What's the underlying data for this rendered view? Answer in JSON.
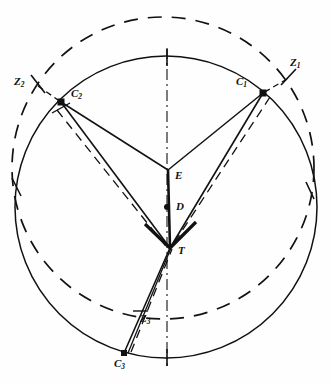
{
  "figure": {
    "colors": {
      "ink": "#111111",
      "background": "#ffffff"
    },
    "circles": [
      {
        "name": "solid-circle",
        "cx": 166,
        "cy": 207,
        "r": 151,
        "style": "solid"
      },
      {
        "name": "dashed-circle",
        "cx": 163,
        "cy": 168,
        "r": 151,
        "style": "dashed"
      }
    ],
    "axis": {
      "name": "vertical-dash-dot-axis",
      "x1": 167,
      "y1": 52,
      "x2": 167,
      "y2": 362,
      "style": "dash-dot"
    },
    "points": [
      {
        "id": "C1",
        "label": "C",
        "sub": "1",
        "x": 263,
        "y": 93,
        "label_x": 238,
        "label_y": 82,
        "dot": true
      },
      {
        "id": "C2",
        "label": "C",
        "sub": "2",
        "x": 61,
        "y": 102,
        "label_x": 70,
        "label_y": 92,
        "dot": true
      },
      {
        "id": "C3",
        "label": "C",
        "sub": "3",
        "x": 124,
        "y": 353,
        "label_x": 115,
        "label_y": 360,
        "dot": true
      },
      {
        "id": "Z1",
        "label": "Z",
        "sub": "1",
        "x": 288,
        "y": 77,
        "label_x": 291,
        "label_y": 58,
        "dot": false
      },
      {
        "id": "Z2",
        "label": "Z",
        "sub": "2",
        "x": 38,
        "y": 84,
        "label_x": 17,
        "label_y": 79,
        "dot": false
      },
      {
        "id": "Z3",
        "label": "Z",
        "sub": "3",
        "x": 140,
        "y": 317,
        "label_x": 141,
        "label_y": 315,
        "dot": false
      },
      {
        "id": "E",
        "label": "E",
        "sub": "",
        "x": 168,
        "y": 170,
        "label_x": 174,
        "label_y": 167,
        "dot": false
      },
      {
        "id": "D",
        "label": "D",
        "sub": "",
        "x": 167,
        "y": 207,
        "label_x": 175,
        "label_y": 203,
        "dot": true
      },
      {
        "id": "T",
        "label": "T",
        "sub": "",
        "x": 170,
        "y": 248,
        "label_x": 177,
        "label_y": 245,
        "dot": false
      }
    ],
    "solid_segments": [
      {
        "name": "segment-C1-E",
        "from": "C1",
        "to": "E"
      },
      {
        "name": "segment-C2-E",
        "from": "C2",
        "to": "E"
      },
      {
        "name": "segment-E-T",
        "from": "E",
        "to": "T"
      },
      {
        "name": "segment-C1-T",
        "from": "C1",
        "to": "T"
      },
      {
        "name": "segment-C2-T",
        "from": "C2",
        "to": "T"
      },
      {
        "name": "segment-C3-T",
        "from": "C3",
        "to": "T"
      },
      {
        "name": "segment-C3-Z3-upper",
        "from": "C3",
        "to": "T"
      }
    ],
    "dashed_segments": [
      {
        "name": "dashed-C1-T",
        "from": "C1",
        "to": "T"
      },
      {
        "name": "dashed-C2-T",
        "from": "C2",
        "to": "T"
      },
      {
        "name": "dashed-C3-T",
        "from": "C3",
        "to": "T"
      },
      {
        "name": "dashed-Z1-C1",
        "from": "Z1",
        "to": "C1"
      },
      {
        "name": "dashed-Z2-C2",
        "from": "Z2",
        "to": "C2"
      }
    ],
    "tick_marks": [
      {
        "name": "tick-top-axis",
        "x": 167,
        "y": 57
      },
      {
        "name": "tick-bottom-axis",
        "x": 167,
        "y": 357
      },
      {
        "name": "tick-Z1",
        "x": 288,
        "y": 77
      },
      {
        "name": "tick-Z2",
        "x": 38,
        "y": 84
      },
      {
        "name": "tick-left-intersection",
        "x": 16,
        "y": 186
      },
      {
        "name": "tick-right-intersection",
        "x": 310,
        "y": 190
      }
    ]
  }
}
